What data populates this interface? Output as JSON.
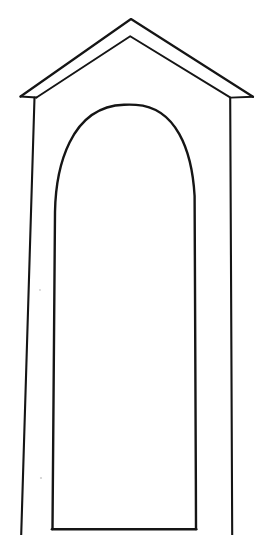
{
  "page": {
    "title": "Arched niche line drawing",
    "background_color": "#ffffff",
    "width": 263,
    "height": 535,
    "caption": ""
  },
  "drawing": {
    "name": "arched-niche-with-gable-roof",
    "description": "Hand-drawn black outline of a tall narrow shrine or niche: a triangular gable roof drawn as a thin double line, two slightly slanted vertical side pillars, and a tall round-topped arched opening reaching down to a horizontal sill.",
    "line_color": "#151515",
    "fill_color": "#ffffff",
    "style": "hand-drawn-contour",
    "parts": [
      {
        "name": "roof-outer-edge",
        "label": "Roof outer edge",
        "stroke_width": 2.2,
        "path": "M 20.5 96.5 L 131 19 L 253 96.8"
      },
      {
        "name": "roof-inner-edge",
        "label": "Roof inner edge (soffit)",
        "stroke_width": 1.9,
        "path": "M 36.5 97.5 L 130.2 36.2 L 230.5 97.6"
      },
      {
        "name": "roof-left-tip-return",
        "label": "Left eave tip return",
        "stroke_width": 2.0,
        "path": "M 20.5 96.5 L 36.5 97.5"
      },
      {
        "name": "roof-right-tip-return",
        "label": "Right eave tip return",
        "stroke_width": 2.0,
        "path": "M 253 96.8 L 230.5 97.6"
      },
      {
        "name": "left-outer-pillar-edge",
        "label": "Left outer pillar edge",
        "stroke_width": 2.1,
        "path": "M 34.5 97.5 C 30.5 190 25.5 360 21.2 535"
      },
      {
        "name": "right-outer-pillar-edge",
        "label": "Right outer pillar edge",
        "stroke_width": 2.1,
        "path": "M 230.2 98.5 C 230.8 210 231.6 400 232.2 535"
      },
      {
        "name": "arch-opening",
        "label": "Arched opening outline",
        "stroke_width": 2.4,
        "path": "M 52.5 529 C 53.4 420 54.2 300 55.0 212 C 55.8 168 70 106.5 124 104.8 C 128 104.6 132 104.6 136 104.9 C 176 107.4 192 150 194.6 196 C 195.2 260 195.6 400 196.0 529"
      },
      {
        "name": "opening-sill",
        "label": "Opening sill (bottom line)",
        "stroke_width": 2.6,
        "path": "M 52.0 529.2 L 196.2 529.2"
      }
    ],
    "key_points": [
      {
        "name": "roof-apex",
        "x": 131,
        "y": 19
      },
      {
        "name": "roof-apex-inner",
        "x": 130,
        "y": 36
      },
      {
        "name": "left-eave-tip",
        "x": 20,
        "y": 96
      },
      {
        "name": "right-eave-tip",
        "x": 253,
        "y": 97
      },
      {
        "name": "left-pillar-top",
        "x": 35,
        "y": 97
      },
      {
        "name": "right-pillar-top",
        "x": 230,
        "y": 98
      },
      {
        "name": "left-pillar-bottom",
        "x": 21,
        "y": 535
      },
      {
        "name": "right-pillar-bottom",
        "x": 232,
        "y": 535
      },
      {
        "name": "arch-crown",
        "x": 133,
        "y": 105
      },
      {
        "name": "arch-left-base",
        "x": 52,
        "y": 529
      },
      {
        "name": "arch-right-base",
        "x": 196,
        "y": 529
      }
    ],
    "specks": [
      {
        "name": "paper-speck-left",
        "x": 41,
        "y": 478,
        "r": 1.1
      },
      {
        "name": "paper-speck-mid",
        "x": 40,
        "y": 290,
        "r": 0.9
      }
    ]
  }
}
